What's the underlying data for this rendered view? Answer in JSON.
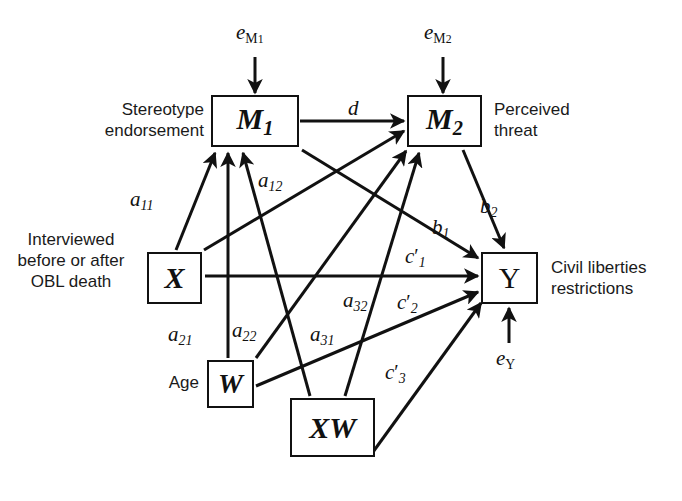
{
  "figure": {
    "type": "path-diagram",
    "background": "#ffffff",
    "line_color": "#111111",
    "footer_note": ""
  },
  "nodes": [
    {
      "id": "M1",
      "label": "M",
      "sub": "1",
      "x": 211,
      "y": 95,
      "w": 88,
      "h": 52,
      "description": "Stereotype\nendorsement",
      "desc_x": 72,
      "desc_y": 100,
      "desc_align": "right"
    },
    {
      "id": "M2",
      "label": "M",
      "sub": "2",
      "x": 407,
      "y": 95,
      "w": 75,
      "h": 52,
      "description": "Perceived\nthreat",
      "desc_x": 494,
      "desc_y": 100,
      "desc_align": "left"
    },
    {
      "id": "X",
      "label": "X",
      "sub": "",
      "x": 147,
      "y": 252,
      "w": 55,
      "h": 52,
      "description": "Interviewed\nbefore or after\nOBL death",
      "desc_x": 4,
      "desc_y": 231,
      "desc_align": "right"
    },
    {
      "id": "Y",
      "label": "Y",
      "sub": "",
      "x": 481,
      "y": 252,
      "w": 57,
      "h": 52,
      "description": "Civil liberties\nrestrictions",
      "desc_x": 551,
      "desc_y": 258,
      "desc_align": "left"
    },
    {
      "id": "W",
      "label": "W",
      "sub": "",
      "x": 207,
      "y": 360,
      "w": 47,
      "h": 48,
      "description": "Age",
      "desc_x": 150,
      "desc_y": 373,
      "desc_align": "right"
    },
    {
      "id": "XW",
      "label": "XW",
      "sub": "",
      "x": 290,
      "y": 398,
      "w": 85,
      "h": 59,
      "description": "",
      "desc_x": 0,
      "desc_y": 0,
      "desc_align": "left"
    }
  ],
  "disturbances": [
    {
      "id": "eM1",
      "base": "e",
      "sub": "M",
      "subsub": "1",
      "x": 236,
      "y": 23,
      "target": "M1"
    },
    {
      "id": "eM2",
      "base": "e",
      "sub": "M",
      "subsub": "2",
      "x": 424,
      "y": 23,
      "target": "M2"
    },
    {
      "id": "eY",
      "base": "e",
      "sub": "Y",
      "subsub": "",
      "x": 496,
      "y": 349,
      "target": "Y"
    }
  ],
  "paths": [
    {
      "id": "d",
      "label": "d",
      "sub": "",
      "prime": false,
      "from": "M1",
      "to": "M2",
      "lx": 348,
      "ly": 108
    },
    {
      "id": "a11",
      "label": "a",
      "sub": "11",
      "prime": false,
      "from": "X",
      "to": "M1",
      "lx": 130,
      "ly": 191
    },
    {
      "id": "a12",
      "label": "a",
      "sub": "12",
      "prime": false,
      "from": "X",
      "to": "M2",
      "lx": 258,
      "ly": 172
    },
    {
      "id": "a21",
      "label": "a",
      "sub": "21",
      "prime": false,
      "from": "W",
      "to": "M1",
      "lx": 170,
      "ly": 325
    },
    {
      "id": "a22",
      "label": "a",
      "sub": "22",
      "prime": false,
      "from": "W",
      "to": "M2",
      "lx": 234,
      "ly": 321
    },
    {
      "id": "a31",
      "label": "a",
      "sub": "31",
      "prime": false,
      "from": "XW",
      "to": "M1",
      "lx": 311,
      "ly": 325
    },
    {
      "id": "a32",
      "label": "a",
      "sub": "32",
      "prime": false,
      "from": "XW",
      "to": "M2",
      "lx": 344,
      "ly": 291
    },
    {
      "id": "b1",
      "label": "b",
      "sub": "1",
      "prime": false,
      "from": "M1",
      "to": "Y",
      "lx": 432,
      "ly": 219
    },
    {
      "id": "b2",
      "label": "b",
      "sub": "2",
      "prime": false,
      "from": "M2",
      "to": "Y",
      "lx": 480,
      "ly": 198
    },
    {
      "id": "c1",
      "label": "c",
      "sub": "1",
      "prime": true,
      "from": "X",
      "to": "Y",
      "lx": 406,
      "ly": 248
    },
    {
      "id": "c2",
      "label": "c",
      "sub": "2",
      "prime": true,
      "from": "W",
      "to": "Y",
      "lx": 398,
      "ly": 294
    },
    {
      "id": "c3",
      "label": "c",
      "sub": "3",
      "prime": true,
      "from": "XW",
      "to": "Y",
      "lx": 386,
      "ly": 364
    }
  ]
}
